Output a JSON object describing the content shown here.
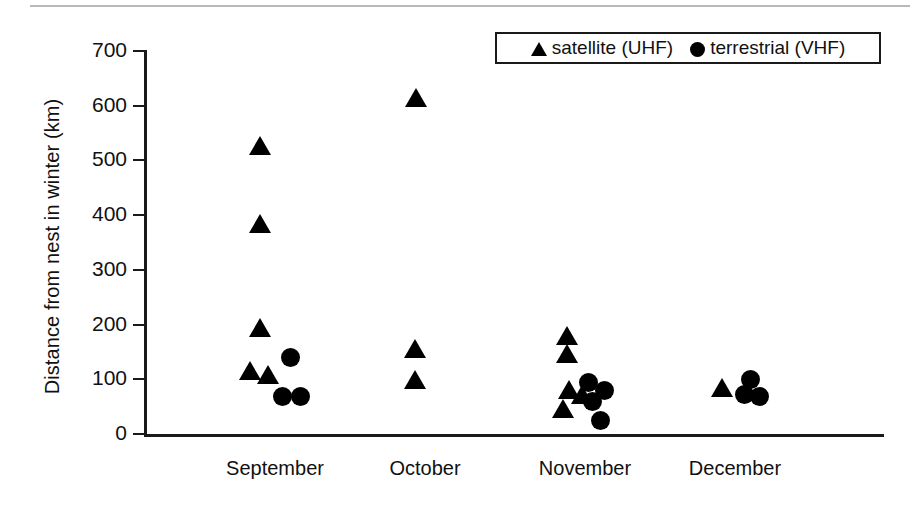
{
  "chart_data": {
    "type": "scatter",
    "title": "",
    "xlabel": "",
    "ylabel": "Distance from nest in winter (km)",
    "ylim": [
      0,
      700
    ],
    "ytick_step": 100,
    "yticks": [
      0,
      100,
      200,
      300,
      400,
      500,
      600,
      700
    ],
    "ytick_labels": [
      "0",
      "100",
      "200",
      "300",
      "400",
      "500",
      "600",
      "700"
    ],
    "grid": false,
    "categories": [
      "September",
      "October",
      "November",
      "December"
    ],
    "legend_position": "top-right",
    "series": [
      {
        "name": "satellite (UHF)",
        "marker": "triangle",
        "color": "#000000",
        "points": [
          {
            "category": "September",
            "x_offset": -0.1,
            "y": 523
          },
          {
            "category": "September",
            "x_offset": -0.1,
            "y": 381
          },
          {
            "category": "September",
            "x_offset": -0.1,
            "y": 190
          },
          {
            "category": "September",
            "x_offset": -0.17,
            "y": 112
          },
          {
            "category": "September",
            "x_offset": -0.05,
            "y": 105
          },
          {
            "category": "October",
            "x_offset": -0.06,
            "y": 610
          },
          {
            "category": "October",
            "x_offset": -0.07,
            "y": 153
          },
          {
            "category": "October",
            "x_offset": -0.07,
            "y": 95
          },
          {
            "category": "November",
            "x_offset": -0.12,
            "y": 175
          },
          {
            "category": "November",
            "x_offset": -0.12,
            "y": 143
          },
          {
            "category": "November",
            "x_offset": -0.11,
            "y": 78
          },
          {
            "category": "November",
            "x_offset": -0.02,
            "y": 68
          },
          {
            "category": "November",
            "x_offset": -0.15,
            "y": 43
          },
          {
            "category": "December",
            "x_offset": -0.09,
            "y": 80
          }
        ]
      },
      {
        "name": "terrestrial (VHF)",
        "marker": "circle",
        "color": "#000000",
        "points": [
          {
            "category": "September",
            "x_offset": 0.1,
            "y": 140
          },
          {
            "category": "September",
            "x_offset": 0.05,
            "y": 68
          },
          {
            "category": "September",
            "x_offset": 0.17,
            "y": 68
          },
          {
            "category": "November",
            "x_offset": 0.02,
            "y": 95
          },
          {
            "category": "November",
            "x_offset": 0.13,
            "y": 79
          },
          {
            "category": "November",
            "x_offset": 0.05,
            "y": 59
          },
          {
            "category": "November",
            "x_offset": 0.1,
            "y": 24
          },
          {
            "category": "December",
            "x_offset": 0.1,
            "y": 100
          },
          {
            "category": "December",
            "x_offset": 0.06,
            "y": 72
          },
          {
            "category": "December",
            "x_offset": 0.16,
            "y": 68
          }
        ]
      }
    ]
  },
  "legend": {
    "entries": [
      {
        "label": "satellite (UHF)",
        "symbol": "triangle-icon"
      },
      {
        "label": "terrestrial (VHF)",
        "symbol": "circle-icon"
      }
    ]
  }
}
